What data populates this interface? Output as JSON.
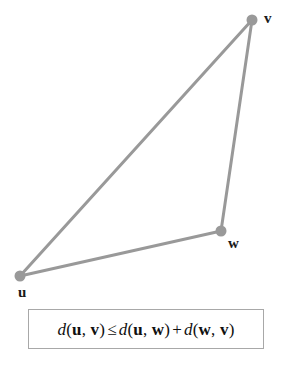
{
  "figure": {
    "type": "geometric-diagram",
    "background_color": "#ffffff",
    "width": 289,
    "height": 370
  },
  "diagram": {
    "stroke_color": "#999999",
    "stroke_width": 3,
    "vertex_color": "#999999",
    "vertex_radius": 5,
    "vertices": [
      {
        "name": "u",
        "label": "u",
        "x": 20,
        "y": 276
      },
      {
        "name": "v",
        "label": "v",
        "x": 252,
        "y": 20
      },
      {
        "name": "w",
        "label": "w",
        "x": 221,
        "y": 231
      }
    ],
    "edges": [
      {
        "name": "edge-u-v",
        "from": "u",
        "to": "v"
      },
      {
        "name": "edge-u-w",
        "from": "u",
        "to": "w"
      },
      {
        "name": "edge-w-v",
        "from": "w",
        "to": "v"
      }
    ],
    "labels": {
      "u": "u",
      "v": "v",
      "w": "w"
    }
  },
  "formula": {
    "box_border_color": "#a8a8a8",
    "plain_text": "d(u, v) ≤ d(u, w) + d(w, v)",
    "parts": {
      "d1": "d",
      "open1": "(",
      "u1": "u",
      "comma1": ", ",
      "v1": "v",
      "close1": ")",
      "leq": "≤",
      "d2": "d",
      "open2": "(",
      "u2": "u",
      "comma2": ", ",
      "w1": "w",
      "close2": ")",
      "plus": "+",
      "d3": "d",
      "open3": "(",
      "w2": "w",
      "comma3": ", ",
      "v2": "v",
      "close3": ")"
    }
  }
}
